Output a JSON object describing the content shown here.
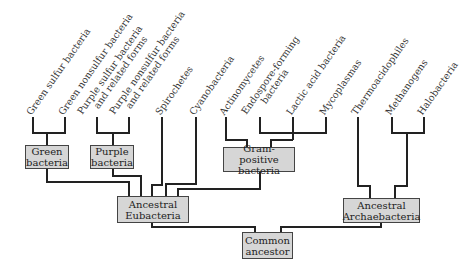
{
  "diagram": {
    "type": "phylogenetic-tree",
    "leaves": [
      {
        "id": "green-sulfur",
        "lines": [
          "Green sulfur bacteria"
        ]
      },
      {
        "id": "green-nonsulfur",
        "lines": [
          "Green nonsulfur bacteria"
        ]
      },
      {
        "id": "purple-sulfur",
        "lines": [
          "Purple sulfur bacteria",
          "and related forms"
        ]
      },
      {
        "id": "purple-nonsulfur",
        "lines": [
          "Purple nonsulfur bacteria",
          "and related forms"
        ]
      },
      {
        "id": "spirochetes",
        "lines": [
          "Spirochetes"
        ]
      },
      {
        "id": "cyanobacteria",
        "lines": [
          "Cyanobacteria"
        ]
      },
      {
        "id": "actinomycetes",
        "lines": [
          "Actinomycetes"
        ]
      },
      {
        "id": "endospore",
        "lines": [
          "Endospore-forming",
          "bacteria"
        ]
      },
      {
        "id": "lactic",
        "lines": [
          "Lactic acid bacteria"
        ]
      },
      {
        "id": "mycoplasmas",
        "lines": [
          "Mycoplasmas"
        ]
      },
      {
        "id": "thermoacidophiles",
        "lines": [
          "Thermoacidophiles"
        ]
      },
      {
        "id": "methanogens",
        "lines": [
          "Methanogens"
        ]
      },
      {
        "id": "halobacteria",
        "lines": [
          "Halobacteria"
        ]
      }
    ],
    "nodes": {
      "green_bacteria": {
        "line1": "Green",
        "line2": "bacteria"
      },
      "purple_bacteria": {
        "line1": "Purple",
        "line2": "bacteria"
      },
      "gram_positive": {
        "line1": "Gram-positive",
        "line2": "bacteria"
      },
      "ancestral_eubacteria": {
        "line1": "Ancestral",
        "line2": "Eubacteria"
      },
      "ancestral_archaebacteria": {
        "line1": "Ancestral",
        "line2": "Archaebacteria"
      },
      "common_ancestor": {
        "line1": "Common",
        "line2": "ancestor"
      }
    },
    "colors": {
      "box_fill": "#d6d6d6",
      "line": "#222222",
      "text": "#2a2a2a"
    }
  }
}
